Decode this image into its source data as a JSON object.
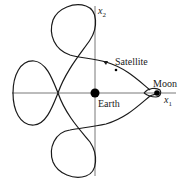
{
  "diagram": {
    "labels": {
      "x1_axis": "x",
      "x1_sub": "1",
      "x2_axis": "x",
      "x2_sub": "2",
      "satellite": "Satellite",
      "moon": "Moon",
      "earth": "Earth"
    },
    "colors": {
      "stroke": "#1a1a1a",
      "axis": "#4a4a4a",
      "background": "#ffffff"
    },
    "bodies": [
      {
        "name": "Earth",
        "x": 95,
        "y": 93,
        "r": 4.5
      },
      {
        "name": "Moon",
        "x": 157,
        "y": 93,
        "r": 2.8
      },
      {
        "name": "Satellite",
        "x": 116,
        "y": 70,
        "r": 1.2
      }
    ]
  }
}
